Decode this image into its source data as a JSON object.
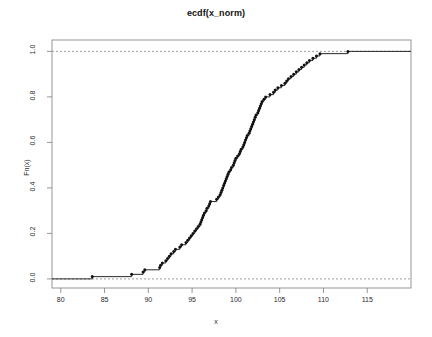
{
  "chart_data": {
    "type": "line",
    "subtype": "ecdf-step",
    "title": "ecdf(x_norm)",
    "xlabel": "x",
    "ylabel": "Fn(x)",
    "xlim": [
      79.0,
      120.0
    ],
    "ylim": [
      -0.04,
      1.05
    ],
    "xticks": [
      80,
      85,
      90,
      95,
      100,
      105,
      110,
      115
    ],
    "yticks": [
      0.0,
      0.2,
      0.4,
      0.6,
      0.8,
      1.0
    ],
    "xtick_labels": [
      "80",
      "85",
      "90",
      "95",
      "100",
      "105",
      "110",
      "115"
    ],
    "ytick_labels": [
      "0.0",
      "0.2",
      "0.4",
      "0.6",
      "0.8",
      "1.0"
    ],
    "grid": false,
    "legend": null,
    "reference_lines": [
      {
        "orientation": "horizontal",
        "value": 0.0,
        "style": "dashed",
        "color": "#888888"
      },
      {
        "orientation": "horizontal",
        "value": 1.0,
        "style": "dashed",
        "color": "#888888"
      }
    ],
    "n_points": 100,
    "point_color": "#111111",
    "line_color": "#111111",
    "point_radius": 1.5,
    "x": [
      83.6,
      88.1,
      89.4,
      89.6,
      91.3,
      91.4,
      91.6,
      92.0,
      92.2,
      92.4,
      92.6,
      92.9,
      93.1,
      93.6,
      93.8,
      94.3,
      94.5,
      94.7,
      94.9,
      95.1,
      95.3,
      95.5,
      95.7,
      95.9,
      96.0,
      96.1,
      96.2,
      96.3,
      96.4,
      96.6,
      96.7,
      96.9,
      97.0,
      97.1,
      97.8,
      98.0,
      98.2,
      98.3,
      98.4,
      98.5,
      98.6,
      98.7,
      98.8,
      98.9,
      99.0,
      99.1,
      99.2,
      99.4,
      99.5,
      99.7,
      99.8,
      99.9,
      100.0,
      100.2,
      100.4,
      100.5,
      100.6,
      100.8,
      100.9,
      101.0,
      101.1,
      101.2,
      101.3,
      101.5,
      101.6,
      101.7,
      101.8,
      101.9,
      102.0,
      102.1,
      102.2,
      102.3,
      102.5,
      102.6,
      102.7,
      102.8,
      102.9,
      103.0,
      103.2,
      103.4,
      103.9,
      104.3,
      104.5,
      104.8,
      105.2,
      105.6,
      105.8,
      106.0,
      106.3,
      106.6,
      106.9,
      107.2,
      107.5,
      107.8,
      108.1,
      108.4,
      108.8,
      109.2,
      109.6,
      112.8
    ],
    "y": [
      0.01,
      0.02,
      0.03,
      0.04,
      0.05,
      0.06,
      0.07,
      0.08,
      0.09,
      0.1,
      0.11,
      0.12,
      0.13,
      0.14,
      0.15,
      0.16,
      0.17,
      0.18,
      0.19,
      0.2,
      0.21,
      0.22,
      0.23,
      0.24,
      0.25,
      0.26,
      0.27,
      0.28,
      0.29,
      0.3,
      0.31,
      0.32,
      0.33,
      0.34,
      0.35,
      0.36,
      0.37,
      0.38,
      0.39,
      0.4,
      0.41,
      0.42,
      0.43,
      0.44,
      0.45,
      0.46,
      0.47,
      0.48,
      0.49,
      0.5,
      0.51,
      0.52,
      0.53,
      0.54,
      0.55,
      0.56,
      0.57,
      0.58,
      0.59,
      0.6,
      0.61,
      0.62,
      0.63,
      0.64,
      0.65,
      0.66,
      0.67,
      0.68,
      0.69,
      0.7,
      0.71,
      0.72,
      0.73,
      0.74,
      0.75,
      0.76,
      0.77,
      0.78,
      0.79,
      0.8,
      0.81,
      0.82,
      0.83,
      0.84,
      0.85,
      0.86,
      0.87,
      0.88,
      0.89,
      0.9,
      0.91,
      0.92,
      0.93,
      0.94,
      0.95,
      0.96,
      0.97,
      0.98,
      0.99,
      1.0
    ]
  },
  "plot_box": {
    "left": 52,
    "right": 411,
    "top": 40,
    "bottom": 288
  }
}
